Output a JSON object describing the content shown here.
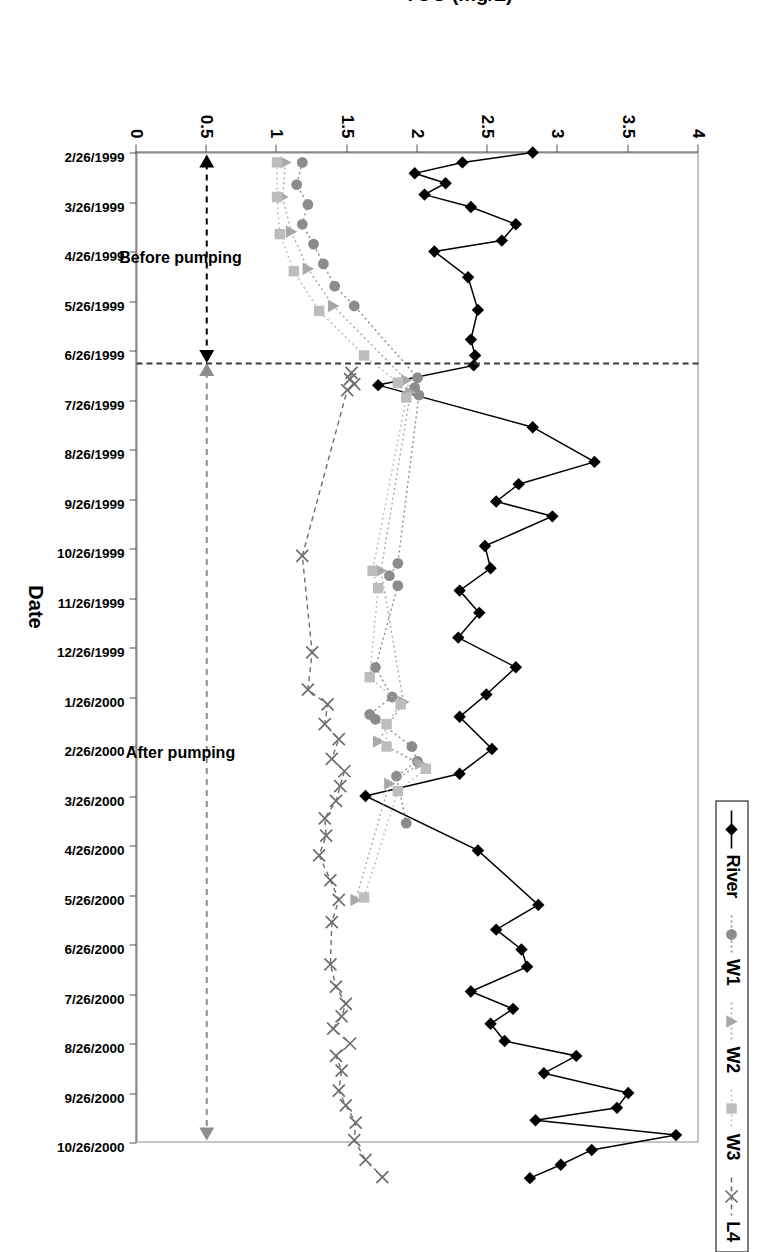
{
  "chart_data": {
    "type": "line",
    "title": "",
    "xlabel": "Date",
    "ylabel": "TOC (mg/L)",
    "ylim": [
      0,
      4
    ],
    "ytick_labels": [
      "0",
      "0.5",
      "1",
      "1.5",
      "2",
      "2.5",
      "3",
      "3.5",
      "4"
    ],
    "ytick_values": [
      0,
      0.5,
      1,
      1.5,
      2,
      2.5,
      3,
      3.5,
      4
    ],
    "grid": false,
    "legend_position": "top-right",
    "categories": [
      "2/26/1999",
      "3/26/1999",
      "4/26/1999",
      "5/26/1999",
      "6/26/1999",
      "7/26/1999",
      "8/26/1999",
      "9/26/1999",
      "10/26/1999",
      "11/26/1999",
      "12/26/1999",
      "1/26/2000",
      "2/26/2000",
      "3/26/2000",
      "4/26/2000",
      "5/26/2000",
      "6/26/2000",
      "7/26/2000",
      "8/26/2000",
      "9/26/2000",
      "10/26/2000"
    ],
    "series": [
      {
        "name": "River",
        "marker": "diamond",
        "color": "#000000",
        "linestyle": "solid",
        "points": [
          {
            "x": 0.0,
            "y": 2.82
          },
          {
            "x": 0.2,
            "y": 2.32
          },
          {
            "x": 0.42,
            "y": 1.98
          },
          {
            "x": 0.62,
            "y": 2.2
          },
          {
            "x": 0.85,
            "y": 2.05
          },
          {
            "x": 1.1,
            "y": 2.38
          },
          {
            "x": 1.45,
            "y": 2.7
          },
          {
            "x": 1.78,
            "y": 2.6
          },
          {
            "x": 2.0,
            "y": 2.12
          },
          {
            "x": 2.52,
            "y": 2.36
          },
          {
            "x": 3.18,
            "y": 2.43
          },
          {
            "x": 3.78,
            "y": 2.38
          },
          {
            "x": 4.1,
            "y": 2.41
          },
          {
            "x": 4.3,
            "y": 2.4
          },
          {
            "x": 4.7,
            "y": 1.72
          },
          {
            "x": 5.55,
            "y": 2.82
          },
          {
            "x": 6.25,
            "y": 3.26
          },
          {
            "x": 6.7,
            "y": 2.72
          },
          {
            "x": 7.05,
            "y": 2.56
          },
          {
            "x": 7.35,
            "y": 2.96
          },
          {
            "x": 7.95,
            "y": 2.48
          },
          {
            "x": 8.4,
            "y": 2.52
          },
          {
            "x": 8.85,
            "y": 2.3
          },
          {
            "x": 9.3,
            "y": 2.44
          },
          {
            "x": 9.8,
            "y": 2.29
          },
          {
            "x": 10.4,
            "y": 2.7
          },
          {
            "x": 10.95,
            "y": 2.49
          },
          {
            "x": 11.4,
            "y": 2.3
          },
          {
            "x": 12.05,
            "y": 2.53
          },
          {
            "x": 12.55,
            "y": 2.3
          },
          {
            "x": 13.0,
            "y": 1.63
          },
          {
            "x": 14.1,
            "y": 2.43
          },
          {
            "x": 15.2,
            "y": 2.86
          },
          {
            "x": 15.7,
            "y": 2.56
          },
          {
            "x": 16.1,
            "y": 2.74
          },
          {
            "x": 16.45,
            "y": 2.78
          },
          {
            "x": 16.95,
            "y": 2.38
          },
          {
            "x": 17.3,
            "y": 2.68
          },
          {
            "x": 17.6,
            "y": 2.52
          },
          {
            "x": 17.95,
            "y": 2.62
          },
          {
            "x": 18.25,
            "y": 3.13
          },
          {
            "x": 18.6,
            "y": 2.9
          },
          {
            "x": 19.0,
            "y": 3.5
          },
          {
            "x": 19.3,
            "y": 3.42
          },
          {
            "x": 19.55,
            "y": 2.84
          },
          {
            "x": 19.85,
            "y": 3.84
          },
          {
            "x": 20.15,
            "y": 3.24
          },
          {
            "x": 20.45,
            "y": 3.02
          },
          {
            "x": 20.72,
            "y": 2.8
          }
        ]
      },
      {
        "name": "W1",
        "marker": "circle",
        "color": "#8c8c8c",
        "linestyle": "dotted",
        "points": [
          {
            "x": 0.2,
            "y": 1.18
          },
          {
            "x": 0.65,
            "y": 1.14
          },
          {
            "x": 1.05,
            "y": 1.22
          },
          {
            "x": 1.45,
            "y": 1.18
          },
          {
            "x": 1.85,
            "y": 1.26
          },
          {
            "x": 2.25,
            "y": 1.33
          },
          {
            "x": 2.7,
            "y": 1.41
          },
          {
            "x": 3.1,
            "y": 1.55
          },
          {
            "x": 4.55,
            "y": 2.0
          },
          {
            "x": 4.75,
            "y": 1.98
          },
          {
            "x": 4.9,
            "y": 2.01
          },
          {
            "x": 8.3,
            "y": 1.86
          },
          {
            "x": 8.55,
            "y": 1.8
          },
          {
            "x": 8.75,
            "y": 1.86
          },
          {
            "x": 10.4,
            "y": 1.7
          },
          {
            "x": 11.0,
            "y": 1.82
          },
          {
            "x": 11.35,
            "y": 1.66
          },
          {
            "x": 11.45,
            "y": 1.7
          },
          {
            "x": 12.0,
            "y": 1.96
          },
          {
            "x": 12.3,
            "y": 2.0
          },
          {
            "x": 12.6,
            "y": 1.85
          },
          {
            "x": 13.55,
            "y": 1.92
          }
        ]
      },
      {
        "name": "W2",
        "marker": "triangle",
        "color": "#a8a8a8",
        "linestyle": "dotted",
        "points": [
          {
            "x": 0.2,
            "y": 1.06
          },
          {
            "x": 0.9,
            "y": 1.04
          },
          {
            "x": 1.6,
            "y": 1.1
          },
          {
            "x": 2.35,
            "y": 1.22
          },
          {
            "x": 3.1,
            "y": 1.4
          },
          {
            "x": 4.6,
            "y": 1.92
          },
          {
            "x": 4.85,
            "y": 1.95
          },
          {
            "x": 8.45,
            "y": 1.74
          },
          {
            "x": 11.1,
            "y": 1.9
          },
          {
            "x": 11.9,
            "y": 1.72
          },
          {
            "x": 12.35,
            "y": 2.02
          },
          {
            "x": 12.75,
            "y": 1.8
          },
          {
            "x": 15.1,
            "y": 1.56
          }
        ]
      },
      {
        "name": "W3",
        "marker": "square",
        "color": "#bdbdbd",
        "linestyle": "dotted",
        "points": [
          {
            "x": 0.2,
            "y": 1.0
          },
          {
            "x": 0.9,
            "y": 1.0
          },
          {
            "x": 1.65,
            "y": 1.02
          },
          {
            "x": 2.4,
            "y": 1.12
          },
          {
            "x": 3.2,
            "y": 1.3
          },
          {
            "x": 4.1,
            "y": 1.62
          },
          {
            "x": 4.65,
            "y": 1.86
          },
          {
            "x": 4.95,
            "y": 1.92
          },
          {
            "x": 8.45,
            "y": 1.68
          },
          {
            "x": 8.8,
            "y": 1.72
          },
          {
            "x": 10.6,
            "y": 1.66
          },
          {
            "x": 11.15,
            "y": 1.88
          },
          {
            "x": 11.55,
            "y": 1.78
          },
          {
            "x": 12.0,
            "y": 1.78
          },
          {
            "x": 12.45,
            "y": 2.06
          },
          {
            "x": 12.9,
            "y": 1.86
          },
          {
            "x": 15.05,
            "y": 1.62
          }
        ]
      },
      {
        "name": "L4",
        "marker": "x",
        "color": "#6e6e6e",
        "linestyle": "dashed",
        "points": [
          {
            "x": 4.45,
            "y": 1.53
          },
          {
            "x": 4.58,
            "y": 1.52
          },
          {
            "x": 4.68,
            "y": 1.55
          },
          {
            "x": 4.8,
            "y": 1.5
          },
          {
            "x": 8.15,
            "y": 1.18
          },
          {
            "x": 10.1,
            "y": 1.25
          },
          {
            "x": 10.85,
            "y": 1.22
          },
          {
            "x": 11.15,
            "y": 1.36
          },
          {
            "x": 11.55,
            "y": 1.34
          },
          {
            "x": 11.85,
            "y": 1.44
          },
          {
            "x": 12.25,
            "y": 1.39
          },
          {
            "x": 12.5,
            "y": 1.48
          },
          {
            "x": 12.8,
            "y": 1.45
          },
          {
            "x": 13.1,
            "y": 1.42
          },
          {
            "x": 13.45,
            "y": 1.34
          },
          {
            "x": 13.8,
            "y": 1.35
          },
          {
            "x": 14.2,
            "y": 1.3
          },
          {
            "x": 14.7,
            "y": 1.38
          },
          {
            "x": 15.1,
            "y": 1.44
          },
          {
            "x": 15.55,
            "y": 1.39
          },
          {
            "x": 16.4,
            "y": 1.38
          },
          {
            "x": 16.85,
            "y": 1.42
          },
          {
            "x": 17.2,
            "y": 1.49
          },
          {
            "x": 17.45,
            "y": 1.46
          },
          {
            "x": 17.7,
            "y": 1.4
          },
          {
            "x": 18.0,
            "y": 1.52
          },
          {
            "x": 18.25,
            "y": 1.42
          },
          {
            "x": 18.55,
            "y": 1.46
          },
          {
            "x": 18.95,
            "y": 1.44
          },
          {
            "x": 19.25,
            "y": 1.49
          },
          {
            "x": 19.6,
            "y": 1.56
          },
          {
            "x": 19.95,
            "y": 1.55
          },
          {
            "x": 20.35,
            "y": 1.63
          },
          {
            "x": 20.7,
            "y": 1.75
          }
        ]
      }
    ],
    "annotations": [
      {
        "name": "before-pumping",
        "text": "Before pumping",
        "arrow": "double",
        "color": "#000000"
      },
      {
        "name": "after-pumping",
        "text": "After pumping",
        "arrow": "double",
        "color": "#8c8c8c"
      }
    ],
    "divider": {
      "x": 4.25,
      "style": "dashed",
      "label": "pumping-start"
    }
  },
  "legend": {
    "items": [
      {
        "label": "River",
        "marker": "diamond",
        "color": "#000000",
        "line": "solid"
      },
      {
        "label": "W1",
        "marker": "circle",
        "color": "#8c8c8c",
        "line": "dotted"
      },
      {
        "label": "W2",
        "marker": "triangle",
        "color": "#a8a8a8",
        "line": "dotted"
      },
      {
        "label": "W3",
        "marker": "square",
        "color": "#bdbdbd",
        "line": "dotted"
      },
      {
        "label": "L4",
        "marker": "x",
        "color": "#6e6e6e",
        "line": "dashed"
      }
    ]
  },
  "axes": {
    "x_title": "Date",
    "y_title": "TOC (mg/L)"
  }
}
